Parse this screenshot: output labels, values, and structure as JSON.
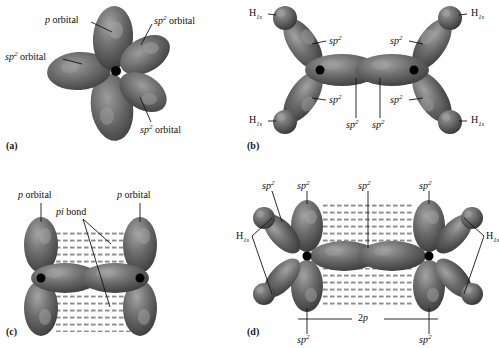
{
  "figure": {
    "background_color": "#ffffff",
    "orbital_color_dark": "#4a4a4a",
    "orbital_color_mid": "#6e6e6e",
    "orbital_color_light": "#a9a9a9",
    "nucleus_color": "#000000",
    "leader_line_color": "#151515"
  },
  "panels": {
    "a": {
      "letter": "(a)",
      "caption_labels": [
        {
          "id": "p-orbital-top",
          "text_html": "<i>p</i> orbital",
          "plain": "p orbital"
        },
        {
          "id": "sp2-orbital-right",
          "text_html": "<i>sp</i><sup>2</sup> orbital",
          "plain": "sp2 orbital"
        },
        {
          "id": "sp2-orbital-left",
          "text_html": "<i>sp</i><sup>2</sup> orbital",
          "plain": "sp2 orbital"
        },
        {
          "id": "sp2-orbital-bottom",
          "text_html": "<i>sp</i><sup>2</sup> orbital",
          "plain": "sp2 orbital"
        }
      ],
      "lobe_count": 5,
      "description": "Single carbon atom showing three sp2 hybrid orbitals and one unhybridized p orbital"
    },
    "b": {
      "letter": "(b)",
      "caption_labels": [
        {
          "id": "h1s-top-left",
          "text_html": "H<sub>1<i>s</i></sub>",
          "plain": "H1s"
        },
        {
          "id": "h1s-top-right",
          "text_html": "H<sub>1<i>s</i></sub>",
          "plain": "H1s"
        },
        {
          "id": "h1s-bottom-left",
          "text_html": "H<sub>1<i>s</i></sub>",
          "plain": "H1s"
        },
        {
          "id": "h1s-bottom-right",
          "text_html": "H<sub>1<i>s</i></sub>",
          "plain": "H1s"
        },
        {
          "id": "sp2-upper-left",
          "text_html": "<i>sp</i><sup>2</sup>",
          "plain": "sp2"
        },
        {
          "id": "sp2-upper-right",
          "text_html": "<i>sp</i><sup>2</sup>",
          "plain": "sp2"
        },
        {
          "id": "sp2-lower-left",
          "text_html": "<i>sp</i><sup>2</sup>",
          "plain": "sp2"
        },
        {
          "id": "sp2-lower-right",
          "text_html": "<i>sp</i><sup>2</sup>",
          "plain": "sp2"
        },
        {
          "id": "sp2-sigma-left",
          "text_html": "<i>sp</i><sup>2</sup>",
          "plain": "sp2"
        },
        {
          "id": "sp2-sigma-right",
          "text_html": "<i>sp</i><sup>2</sup>",
          "plain": "sp2"
        }
      ],
      "description": "Sigma bond framework of ethylene from sp2 orbitals overlapping hydrogen 1s orbitals"
    },
    "c": {
      "letter": "(c)",
      "caption_labels": [
        {
          "id": "p-orbital-left",
          "text_html": "<i>p</i> orbital",
          "plain": "p orbital"
        },
        {
          "id": "p-orbital-right",
          "text_html": "<i>p</i> orbital",
          "plain": "p orbital"
        },
        {
          "id": "pi-bond",
          "text_html": "<i>pi</i> bond",
          "plain": "pi bond"
        }
      ],
      "description": "Two parallel p orbitals overlapping side-by-side to form the pi bond"
    },
    "d": {
      "letter": "(d)",
      "caption_labels": [
        {
          "id": "sp2-top-1",
          "text_html": "<i>sp</i><sup>2</sup>",
          "plain": "sp2"
        },
        {
          "id": "sp2-top-2",
          "text_html": "<i>sp</i><sup>2</sup>",
          "plain": "sp2"
        },
        {
          "id": "sp2-top-3",
          "text_html": "<i>sp</i><sup>2</sup>",
          "plain": "sp2"
        },
        {
          "id": "sp2-top-4",
          "text_html": "<i>sp</i><sup>2</sup>",
          "plain": "sp2"
        },
        {
          "id": "sp2-bottom-left",
          "text_html": "<i>sp</i><sup>2</sup>",
          "plain": "sp2"
        },
        {
          "id": "sp2-bottom-right",
          "text_html": "<i>sp</i><sup>2</sup>",
          "plain": "sp2"
        },
        {
          "id": "h1s-left",
          "text_html": "H<sub>1<i>s</i></sub>",
          "plain": "H1s"
        },
        {
          "id": "h1s-right",
          "text_html": "H<sub>1<i>s</i></sub>",
          "plain": "H1s"
        },
        {
          "id": "two-p",
          "text_html": "2<i>p</i>",
          "plain": "2p"
        }
      ],
      "description": "Complete ethylene molecule with sigma framework and pi bond combined"
    }
  }
}
